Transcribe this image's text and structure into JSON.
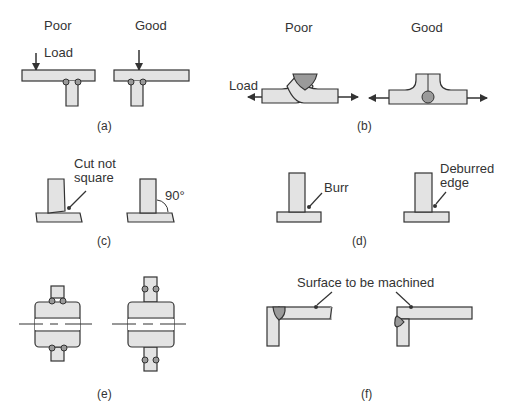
{
  "figure": {
    "panels": [
      {
        "id": "a",
        "caption": "(a)",
        "poor_label": "Poor",
        "good_label": "Good",
        "load_label": "Load"
      },
      {
        "id": "b",
        "caption": "(b)",
        "poor_label": "Poor",
        "good_label": "Good",
        "load_label": "Load"
      },
      {
        "id": "c",
        "caption": "(c)",
        "note_poor": "Cut not\nsquare",
        "note_poor_line1": "Cut not",
        "note_poor_line2": "square",
        "note_good": "90°"
      },
      {
        "id": "d",
        "caption": "(d)",
        "note_poor": "Burr",
        "note_good_line1": "Deburred",
        "note_good_line2": "edge"
      },
      {
        "id": "e",
        "caption": "(e)"
      },
      {
        "id": "f",
        "caption": "(f)",
        "note": "Surface to be machined"
      }
    ],
    "colors": {
      "part_fill": "#e3e3e3",
      "weld_fill": "#9a9a9a",
      "outline": "#333333"
    }
  }
}
